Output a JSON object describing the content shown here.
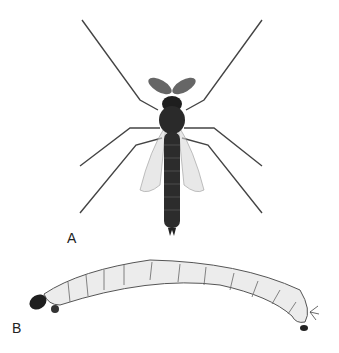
{
  "figure": {
    "panels": [
      {
        "label": "A",
        "subject": "adult midge, dorsal view"
      },
      {
        "label": "B",
        "subject": "larva, lateral view"
      }
    ],
    "colors": {
      "background": "#ffffff",
      "body_dark": "#1e1e1e",
      "larva": "#ececec",
      "outline": "#555555"
    }
  }
}
